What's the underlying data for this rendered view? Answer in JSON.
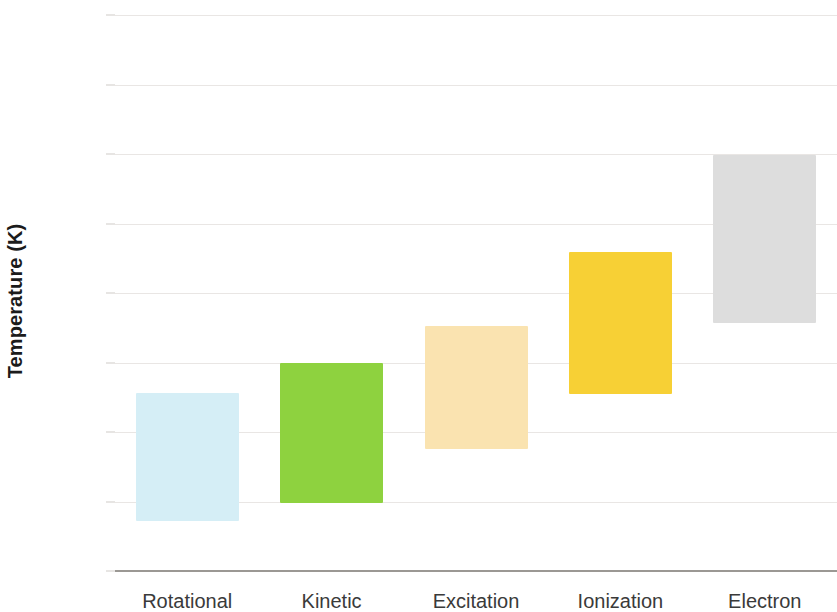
{
  "chart_data": {
    "type": "bar",
    "subtype": "floating-range-bar",
    "title": "",
    "xlabel": "",
    "ylabel": "Temperature (K)",
    "ylim": [
      0,
      16000
    ],
    "ytick_values": [
      0,
      2000,
      4000,
      6000,
      8000,
      10000,
      12000,
      14000,
      16000
    ],
    "ytick_labels": [
      "0",
      "2,000",
      "4,000",
      "6,000",
      "8,000",
      "10,000",
      "12,000",
      "14,000",
      "16,000"
    ],
    "grid": true,
    "grid_axis": "y",
    "legend": "none",
    "categories": [
      "Rotational",
      "Kinetic",
      "Excitation",
      "Ionization",
      "Electron"
    ],
    "bars": [
      {
        "category": "Rotational",
        "low": 1440,
        "high": 5120,
        "color": "#d5eef6"
      },
      {
        "category": "Kinetic",
        "low": 1960,
        "high": 5990,
        "color": "#8ed23f"
      },
      {
        "category": "Excitation",
        "low": 3510,
        "high": 7050,
        "color": "#fae3b0"
      },
      {
        "category": "Ionization",
        "low": 5090,
        "high": 9180,
        "color": "#f7d035"
      },
      {
        "category": "Electron",
        "low": 7140,
        "high": 11970,
        "color": "#dddddd"
      }
    ],
    "series": [
      {
        "name": "low",
        "values": [
          1440,
          1960,
          3510,
          5090,
          7140
        ]
      },
      {
        "name": "high",
        "values": [
          5120,
          5990,
          7050,
          9180,
          11970
        ]
      }
    ],
    "axis_colors": {
      "baseline": "#9b9894",
      "gridline": "#e9e6e4",
      "tick_text": "#4a4a4a",
      "axis_title": "#1b1b1b"
    }
  }
}
